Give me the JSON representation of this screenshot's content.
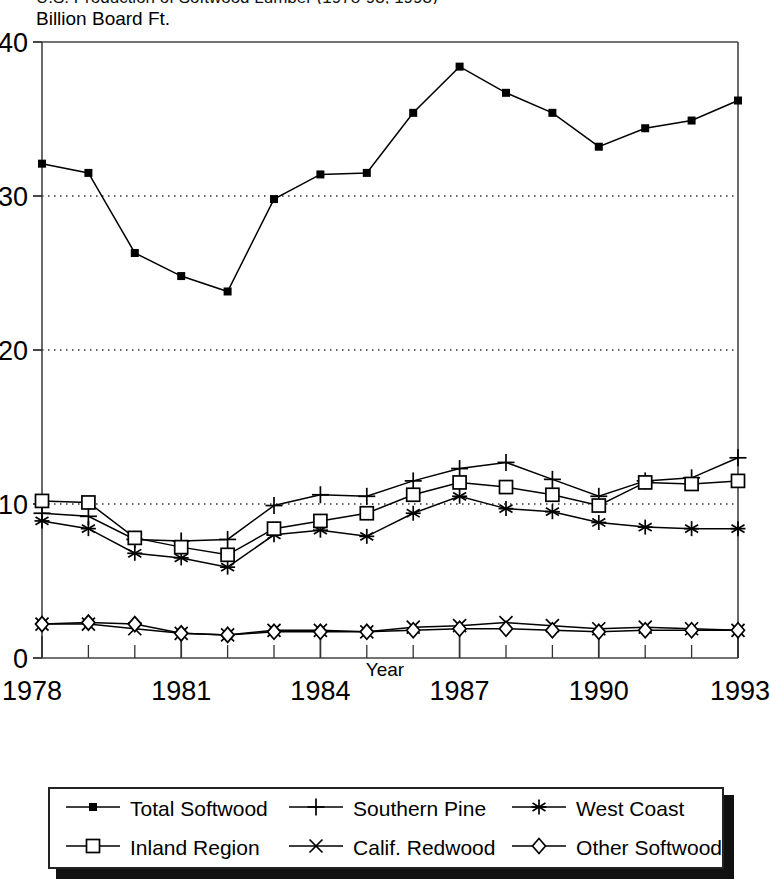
{
  "title": "U.S. Production of Softwood Lumber (1978-93, 1993)",
  "chart_data": {
    "type": "line",
    "title": "U.S. Production of Softwood Lumber (1978-93, 1993)",
    "ylabel": "Billion Board Ft.",
    "xlabel": "Year",
    "ylim": [
      0,
      40
    ],
    "yticks": [
      0,
      10,
      20,
      30,
      40
    ],
    "ytick_labels": [
      "0",
      "10",
      "20",
      "30",
      "40"
    ],
    "xlim": [
      1978,
      1993
    ],
    "x": [
      1978,
      1979,
      1980,
      1981,
      1982,
      1983,
      1984,
      1985,
      1986,
      1987,
      1988,
      1989,
      1990,
      1991,
      1992,
      1993
    ],
    "xticks": [
      1978,
      1981,
      1984,
      1987,
      1990,
      1993
    ],
    "xtick_labels": [
      "1978",
      "1981",
      "1984",
      "1987",
      "1990",
      "1993"
    ],
    "grid": "horizontal-dotted",
    "legend_position": "below",
    "series": [
      {
        "name": "Total Softwood",
        "marker": "filled-square",
        "values": [
          32.1,
          31.5,
          26.3,
          24.8,
          23.8,
          29.8,
          31.4,
          31.5,
          35.4,
          38.4,
          36.7,
          35.4,
          33.2,
          34.4,
          34.9,
          36.2
        ]
      },
      {
        "name": "Southern Pine",
        "marker": "plus",
        "values": [
          9.4,
          9.2,
          7.7,
          7.6,
          7.7,
          9.9,
          10.6,
          10.5,
          11.5,
          12.3,
          12.7,
          11.6,
          10.5,
          11.5,
          11.7,
          13.0
        ]
      },
      {
        "name": "West Coast",
        "marker": "asterisk",
        "values": [
          8.9,
          8.4,
          6.8,
          6.5,
          5.9,
          8.0,
          8.3,
          7.9,
          9.4,
          10.5,
          9.7,
          9.5,
          8.8,
          8.5,
          8.4,
          8.4
        ]
      },
      {
        "name": "Inland Region",
        "marker": "open-square",
        "values": [
          10.2,
          10.1,
          7.8,
          7.2,
          6.7,
          8.4,
          8.9,
          9.4,
          10.6,
          11.4,
          11.1,
          10.6,
          9.9,
          11.4,
          11.3,
          11.5
        ]
      },
      {
        "name": "Calif. Redwood",
        "marker": "cross",
        "values": [
          2.2,
          2.2,
          1.9,
          1.6,
          1.5,
          1.8,
          1.8,
          1.7,
          2.0,
          2.1,
          2.3,
          2.1,
          1.9,
          2.0,
          1.9,
          1.8
        ]
      },
      {
        "name": "Other Softwood",
        "marker": "diamond",
        "values": [
          2.2,
          2.3,
          2.2,
          1.6,
          1.5,
          1.7,
          1.7,
          1.7,
          1.8,
          1.9,
          1.9,
          1.8,
          1.7,
          1.8,
          1.8,
          1.8
        ]
      }
    ]
  },
  "legend": {
    "entries": [
      {
        "label": "Total Softwood",
        "marker": "filled-square"
      },
      {
        "label": "Southern Pine",
        "marker": "plus"
      },
      {
        "label": "West Coast",
        "marker": "asterisk"
      },
      {
        "label": "Inland Region",
        "marker": "open-square"
      },
      {
        "label": "Calif. Redwood",
        "marker": "cross"
      },
      {
        "label": "Other Softwood",
        "marker": "diamond"
      }
    ]
  }
}
